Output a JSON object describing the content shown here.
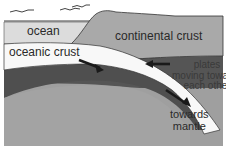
{
  "diagram": {
    "labels": {
      "ocean": "ocean",
      "continental_crust": "continental crust",
      "oceanic_crust": "oceanic crust",
      "plates_line1": "plates",
      "plates_line2": "moving towards",
      "plates_line3": "each other",
      "mantle_line1": "towards",
      "mantle_line2": "mantle"
    },
    "icons": [
      "seagull-icon",
      "seagull-icon",
      "seagull-icon",
      "arrow-icon",
      "arrow-icon",
      "arrow-icon"
    ],
    "colors": {
      "ocean": "#dcdcdc",
      "continental_crust": "#a9a9a9",
      "oceanic_crust": "#ffffff",
      "lithosphere": "#555555",
      "mantle": "#9f9f9f",
      "outline": "#333333"
    }
  }
}
